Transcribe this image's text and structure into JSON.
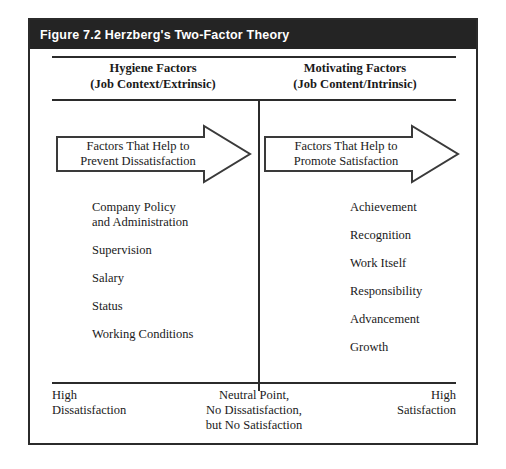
{
  "figure": {
    "title": "Figure 7.2  Herzberg's Two-Factor Theory",
    "accent_color": "#242424",
    "line_color": "#2b2b2b",
    "background_color": "#ffffff"
  },
  "columns": {
    "left": {
      "heading_line1": "Hygiene Factors",
      "heading_line2": "(Job Context/Extrinsic)",
      "arrow": {
        "label_line1": "Factors That Help to",
        "label_line2": "Prevent Dissatisfaction",
        "direction": "right"
      },
      "factors": [
        "Company Policy\nand Administration",
        "Supervision",
        "Salary",
        "Status",
        "Working Conditions"
      ]
    },
    "right": {
      "heading_line1": "Motivating Factors",
      "heading_line2": "(Job Content/Intrinsic)",
      "arrow": {
        "label_line1": "Factors That Help to",
        "label_line2": "Promote Satisfaction",
        "direction": "right"
      },
      "factors": [
        "Achievement",
        "Recognition",
        "Work Itself",
        "Responsibility",
        "Advancement",
        "Growth"
      ]
    }
  },
  "scale": {
    "left_label": "High\nDissatisfaction",
    "center_label": "Neutral Point,\nNo Dissatisfaction,\nbut No Satisfaction",
    "right_label": "High\nSatisfaction"
  }
}
